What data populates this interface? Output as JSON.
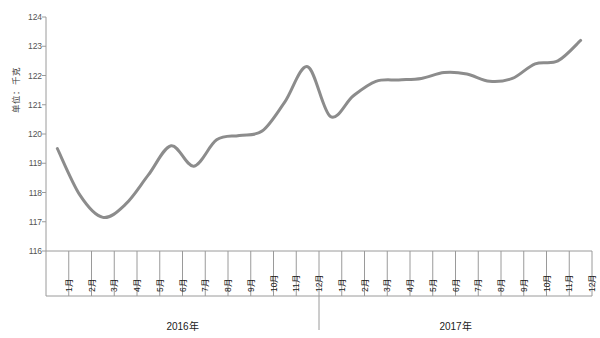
{
  "chart_data": {
    "type": "line",
    "title": "",
    "xlabel": "",
    "ylabel": "单位：千克",
    "ylim": [
      116,
      124
    ],
    "yticks": [
      116,
      117,
      118,
      119,
      120,
      121,
      122,
      123,
      124
    ],
    "ytick_labels": [
      "116",
      "117",
      "118",
      "119",
      "120",
      "121",
      "122",
      "123",
      "124"
    ],
    "grid": false,
    "legend": "none",
    "line_color": "#8c8c8c",
    "categories": [
      "1月",
      "2月",
      "3月",
      "4月",
      "5月",
      "6月",
      "7月",
      "8月",
      "9月",
      "10月",
      "11月",
      "12月",
      "1月",
      "2月",
      "3月",
      "4月",
      "5月",
      "6月",
      "7月",
      "8月",
      "9月",
      "10月",
      "11月",
      "12月"
    ],
    "group_labels": [
      "2016年",
      "2017年"
    ],
    "groups": [
      {
        "label": "2016年",
        "start_index": 0,
        "end_index": 11
      },
      {
        "label": "2017年",
        "start_index": 12,
        "end_index": 23
      }
    ],
    "values": [
      119.5,
      117.9,
      117.15,
      117.6,
      118.6,
      119.6,
      118.9,
      119.8,
      119.95,
      120.1,
      121.1,
      122.3,
      120.6,
      121.3,
      121.8,
      121.85,
      121.9,
      122.1,
      122.05,
      121.8,
      121.9,
      122.4,
      122.5,
      123.2
    ],
    "series": [
      {
        "name": "",
        "values": [
          119.5,
          117.9,
          117.15,
          117.6,
          118.6,
          119.6,
          118.9,
          119.8,
          119.95,
          120.1,
          121.1,
          122.3,
          120.6,
          121.3,
          121.8,
          121.85,
          121.9,
          122.1,
          122.05,
          121.8,
          121.9,
          122.4,
          122.5,
          123.2
        ]
      }
    ]
  }
}
